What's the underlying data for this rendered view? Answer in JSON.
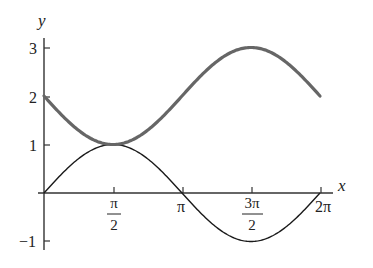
{
  "chart_data": {
    "type": "line",
    "title": "",
    "xlabel": "x",
    "ylabel": "y",
    "xlim": [
      0,
      6.6
    ],
    "ylim": [
      -1.1,
      3.2
    ],
    "grid": false,
    "legend": null,
    "x_ticks": [
      {
        "value": 1.5708,
        "label_num": "π",
        "label_den": "2"
      },
      {
        "value": 3.1416,
        "label": "π"
      },
      {
        "value": 4.7124,
        "label_num": "3π",
        "label_den": "2"
      },
      {
        "value": 6.2832,
        "label": "2π"
      }
    ],
    "y_ticks": [
      {
        "value": 3,
        "label": "3"
      },
      {
        "value": 2,
        "label": "2"
      },
      {
        "value": 1,
        "label": "1"
      },
      {
        "value": -1,
        "label": "−1"
      }
    ],
    "series": [
      {
        "name": "y = 2 − sin x",
        "style": "thick",
        "color": "#666666",
        "x": [
          0,
          0.7854,
          1.5708,
          2.3562,
          3.1416,
          3.927,
          4.7124,
          5.4978,
          6.2832
        ],
        "values": [
          2,
          1.293,
          1,
          1.293,
          2,
          2.707,
          3,
          2.707,
          2
        ]
      },
      {
        "name": "y = sin x",
        "style": "thin",
        "color": "#1a1a1a",
        "x": [
          0,
          0.7854,
          1.5708,
          2.3562,
          3.1416,
          3.927,
          4.7124,
          5.4978,
          6.2832
        ],
        "values": [
          0,
          0.707,
          1,
          0.707,
          0,
          -0.707,
          -1,
          -0.707,
          0
        ]
      }
    ]
  },
  "labels": {
    "x_axis": "x",
    "y_axis": "y",
    "x_ticks": {
      "pi_half_num": "π",
      "pi_half_den": "2",
      "pi": "π",
      "three_pi_half_num": "3π",
      "three_pi_half_den": "2",
      "two_pi": "2π"
    },
    "y_ticks": {
      "three": "3",
      "two": "2",
      "one": "1",
      "neg_one": "−1"
    }
  }
}
